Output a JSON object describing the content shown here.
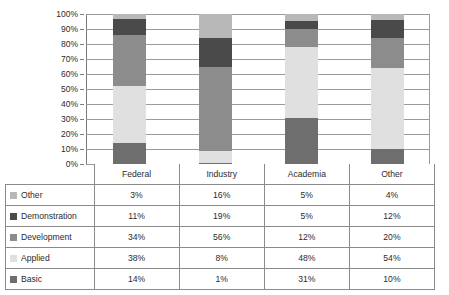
{
  "chart_data": {
    "type": "bar",
    "subtype": "100% stacked bar with data table",
    "title": "",
    "xlabel": "",
    "ylabel": "",
    "ylim": [
      0,
      100
    ],
    "grid": true,
    "legend_position": "table-left-column",
    "categories": [
      "Federal",
      "Industry",
      "Academia",
      "Other"
    ],
    "ytick_labels": [
      "100%",
      "90%",
      "80%",
      "70%",
      "60%",
      "50%",
      "40%",
      "30%",
      "20%",
      "10%",
      "0%"
    ],
    "ytick_values": [
      100,
      90,
      80,
      70,
      60,
      50,
      40,
      30,
      20,
      10,
      0
    ],
    "stack_order_bottom_to_top": [
      "Basic",
      "Applied",
      "Development",
      "Demonstration",
      "Other"
    ],
    "series": [
      {
        "name": "Other",
        "color": "#b8b8b8",
        "values": [
          3,
          16,
          5,
          4
        ],
        "labels": [
          "3%",
          "16%",
          "5%",
          "4%"
        ]
      },
      {
        "name": "Demonstration",
        "color": "#4a4a4a",
        "values": [
          11,
          19,
          5,
          12
        ],
        "labels": [
          "11%",
          "19%",
          "5%",
          "12%"
        ]
      },
      {
        "name": "Development",
        "color": "#8c8c8c",
        "values": [
          34,
          56,
          12,
          20
        ],
        "labels": [
          "34%",
          "56%",
          "12%",
          "20%"
        ]
      },
      {
        "name": "Applied",
        "color": "#e0e0e0",
        "values": [
          38,
          8,
          48,
          54
        ],
        "labels": [
          "38%",
          "8%",
          "48%",
          "54%"
        ]
      },
      {
        "name": "Basic",
        "color": "#6e6e6e",
        "values": [
          14,
          1,
          31,
          10
        ],
        "labels": [
          "14%",
          "1%",
          "31%",
          "10%"
        ]
      }
    ]
  },
  "table": {
    "header": {
      "corner_label": "",
      "columns": [
        "Federal",
        "Industry",
        "Academia",
        "Other"
      ]
    },
    "rows": [
      {
        "label": "Other",
        "swatch_color": "#b8b8b8",
        "cells": [
          "3%",
          "16%",
          "5%",
          "4%"
        ]
      },
      {
        "label": "Demonstration",
        "swatch_color": "#4a4a4a",
        "cells": [
          "11%",
          "19%",
          "5%",
          "12%"
        ]
      },
      {
        "label": "Development",
        "swatch_color": "#8c8c8c",
        "cells": [
          "34%",
          "56%",
          "12%",
          "20%"
        ]
      },
      {
        "label": "Applied",
        "swatch_color": "#e0e0e0",
        "cells": [
          "38%",
          "8%",
          "48%",
          "54%"
        ]
      },
      {
        "label": "Basic",
        "swatch_color": "#6e6e6e",
        "cells": [
          "14%",
          "1%",
          "31%",
          "10%"
        ]
      }
    ]
  },
  "style": {
    "background": "#ffffff",
    "gridline_color": "#9a9a9a",
    "axis_color": "#7a7a7a",
    "border_color": "#8a8a8a",
    "text_color": "#2b2b2b"
  }
}
